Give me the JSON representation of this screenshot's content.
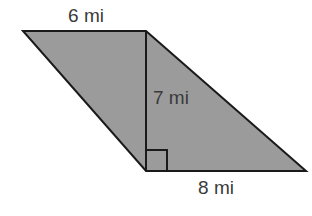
{
  "diagram": {
    "shape": "parallelogram",
    "fill_color": "#9a9a9a",
    "stroke_color": "#1a1a1a",
    "labels": {
      "top_side": "6 mi",
      "height": "7 mi",
      "bottom_side": "8 mi"
    },
    "right_angle_marker": true
  }
}
